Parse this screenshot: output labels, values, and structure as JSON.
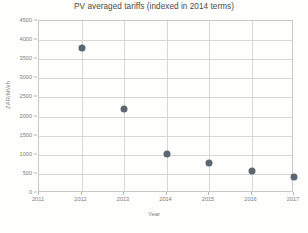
{
  "chart_data": {
    "type": "scatter",
    "title": "PV averaged tariffs (indexed in 2014 terms)",
    "xlabel": "Year",
    "ylabel": "ZAR/MWh",
    "x": [
      2012,
      2013,
      2014,
      2015,
      2016,
      2017
    ],
    "values": [
      3800,
      2200,
      1030,
      780,
      570,
      430
    ],
    "series": [
      {
        "name": "PV averaged tariff",
        "points": [
          {
            "x": 2012,
            "y": 3800
          },
          {
            "x": 2013,
            "y": 2200
          },
          {
            "x": 2014,
            "y": 1030
          },
          {
            "x": 2015,
            "y": 780
          },
          {
            "x": 2016,
            "y": 570
          },
          {
            "x": 2017,
            "y": 430
          }
        ]
      }
    ],
    "xlim": [
      2011,
      2017
    ],
    "ylim": [
      0,
      4500
    ],
    "xticks": [
      "2011",
      "2012",
      "2013",
      "2014",
      "2015",
      "2016",
      "2017"
    ],
    "yticks": [
      "0",
      "500",
      "1000",
      "1500",
      "2000",
      "2500",
      "3000",
      "3500",
      "4000",
      "4500"
    ],
    "grid": true,
    "legend": false,
    "marker_color": "#5b6670",
    "gridline_color": "#d6d6d6",
    "axis_color": "#c8c8c8",
    "text_color": "#7d7d7d",
    "background_color": "#fefefd"
  },
  "artifacts": {
    "note": "faint scanned page bleed-through behind plot",
    "smudges": [
      "",
      "",
      "",
      "",
      "",
      "",
      "",
      ""
    ]
  }
}
